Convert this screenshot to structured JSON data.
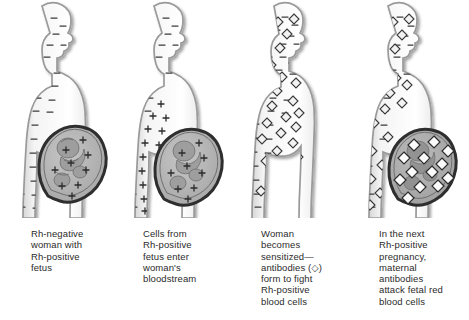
{
  "figure": {
    "background_color": "#ffffff",
    "text_color": "#2b2b2b",
    "body_outline_color": "#9a9a9a",
    "uterus_outline_color": "#2e2e2e",
    "uterus_fill_color": "#b4b4b4",
    "fetus_fill_color": "#9d9d9d",
    "marker_color": "#3a3a3a"
  },
  "panels": [
    {
      "id": "panel-1",
      "number": 1,
      "caption_lines": [
        "Rh-negative",
        "woman with",
        "Rh-positive",
        "fetus"
      ],
      "pregnant": true,
      "maternal_marker": "minus",
      "fetal_marker": "plus",
      "maternal_marker_count": 34,
      "fetal_marker_count": 9,
      "antibodies_present": false
    },
    {
      "id": "panel-2",
      "number": 2,
      "caption_lines": [
        "Cells from",
        "Rh-positive",
        "fetus enter",
        "woman's",
        "bloodstream"
      ],
      "pregnant": true,
      "maternal_marker": "minus",
      "fetal_marker": "plus",
      "maternal_marker_count": 26,
      "fetal_marker_count": 24,
      "antibodies_present": false
    },
    {
      "id": "panel-3",
      "number": 3,
      "caption_lines": [
        "Woman",
        "becomes",
        "sensitized—",
        "antibodies (◇)",
        "form to fight",
        "Rh-positive",
        "blood cells"
      ],
      "pregnant": false,
      "maternal_marker": "minus",
      "fetal_marker": "none",
      "maternal_marker_count": 30,
      "antibody_count": 24,
      "antibodies_present": true,
      "antibody_symbol": "diamond"
    },
    {
      "id": "panel-4",
      "number": 4,
      "caption_lines": [
        "In the next",
        "Rh-positive",
        "pregnancy,",
        "maternal",
        "antibodies",
        "attack fetal red",
        "blood cells"
      ],
      "pregnant": true,
      "maternal_marker": "minus",
      "fetal_marker": "none",
      "maternal_marker_count": 22,
      "antibody_count": 16,
      "uterus_antibody_count": 13,
      "antibodies_present": true,
      "antibody_symbol": "diamond"
    }
  ]
}
